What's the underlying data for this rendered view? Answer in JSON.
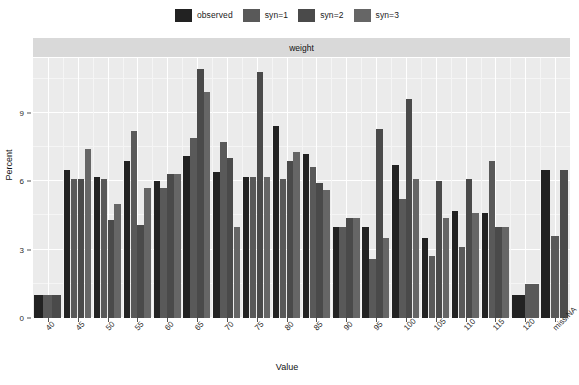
{
  "chart_data": {
    "type": "bar",
    "title": "weight",
    "xlabel": "Value",
    "ylabel": "Percent",
    "ylim": [
      0,
      11.4
    ],
    "yticks": [
      0,
      3,
      6,
      9
    ],
    "grid": true,
    "legend_position": "top",
    "categories": [
      "40",
      "45",
      "50",
      "55",
      "60",
      "65",
      "70",
      "75",
      "80",
      "85",
      "90",
      "95",
      "100",
      "105",
      "110",
      "115",
      "120",
      "miss.NA"
    ],
    "series": [
      {
        "name": "observed",
        "color": "#222222",
        "values": [
          1.0,
          6.5,
          6.2,
          6.9,
          6.0,
          7.1,
          6.4,
          6.2,
          8.4,
          7.2,
          4.0,
          4.0,
          6.7,
          3.5,
          4.7,
          4.6,
          1.0,
          6.5
        ]
      },
      {
        "name": "syn=1",
        "color": "#595959",
        "values": [
          1.0,
          6.1,
          6.1,
          8.2,
          5.7,
          7.9,
          7.7,
          6.2,
          6.1,
          6.6,
          4.0,
          2.6,
          5.2,
          2.7,
          3.1,
          6.9,
          1.5,
          3.6
        ]
      },
      {
        "name": "syn=2",
        "color": "#4a4a4a",
        "values": [
          1.0,
          6.1,
          4.3,
          4.1,
          6.3,
          10.9,
          7.0,
          10.8,
          6.9,
          5.9,
          4.4,
          8.3,
          9.6,
          6.0,
          6.1,
          4.0,
          0.0,
          6.5
        ]
      },
      {
        "name": "syn=3",
        "color": "#666666",
        "values": [
          0.0,
          7.4,
          4.0,
          6.0,
          6.3,
          9.9,
          4.0,
          6.2,
          7.3,
          5.6,
          4.4,
          3.5,
          0.0,
          0.0,
          0.0,
          0.0,
          0.0,
          0.0
        ]
      }
    ],
    "bar_groups": [
      {
        "category": "40",
        "bars": [
          1.0,
          1.0,
          1.0
        ]
      },
      {
        "category": "45",
        "bars": [
          6.5,
          6.1,
          6.1,
          7.4
        ]
      },
      {
        "category": "50",
        "bars": [
          6.2,
          6.1,
          4.3,
          5.0
        ]
      },
      {
        "category": "55",
        "bars": [
          6.9,
          8.2,
          4.1,
          5.7
        ]
      },
      {
        "category": "60",
        "bars": [
          6.0,
          5.7,
          6.3,
          6.3
        ]
      },
      {
        "category": "65",
        "bars": [
          7.1,
          7.9,
          10.9,
          9.9
        ]
      },
      {
        "category": "70",
        "bars": [
          6.4,
          7.7,
          7.0,
          4.0
        ]
      },
      {
        "category": "75",
        "bars": [
          6.2,
          6.2,
          10.8,
          6.2
        ]
      },
      {
        "category": "80",
        "bars": [
          8.4,
          6.1,
          6.9,
          7.3
        ]
      },
      {
        "category": "85",
        "bars": [
          7.2,
          6.6,
          5.9,
          5.6
        ]
      },
      {
        "category": "90",
        "bars": [
          4.0,
          4.0,
          4.4,
          4.4
        ]
      },
      {
        "category": "95",
        "bars": [
          4.0,
          2.6,
          8.3,
          3.5
        ]
      },
      {
        "category": "100",
        "bars": [
          6.7,
          5.2,
          9.6,
          6.1
        ]
      },
      {
        "category": "105",
        "bars": [
          3.5,
          2.7,
          6.0,
          4.4
        ]
      },
      {
        "category": "110",
        "bars": [
          4.7,
          3.1,
          6.1,
          4.6
        ]
      },
      {
        "category": "115",
        "bars": [
          4.6,
          6.9,
          4.0,
          4.0
        ]
      },
      {
        "category": "120",
        "bars": [
          1.0,
          1.5
        ]
      },
      {
        "category": "miss.NA",
        "bars": [
          6.5,
          3.6,
          6.5
        ]
      }
    ]
  },
  "legend": {
    "entries": [
      {
        "label": "observed",
        "color": "#222222"
      },
      {
        "label": "syn=1",
        "color": "#595959"
      },
      {
        "label": "syn=2",
        "color": "#4a4a4a"
      },
      {
        "label": "syn=3",
        "color": "#666666"
      }
    ]
  },
  "panel": {
    "strip_label": "weight"
  },
  "axes": {
    "y_label": "Percent",
    "x_label": "Value",
    "y_ticks": [
      "0",
      "3",
      "6",
      "9"
    ],
    "x_ticks": [
      "40",
      "45",
      "50",
      "55",
      "60",
      "65",
      "70",
      "75",
      "80",
      "85",
      "90",
      "95",
      "100",
      "105",
      "110",
      "115",
      "120",
      "miss.NA"
    ]
  },
  "colors": {
    "panel_background": "#ebebeb",
    "strip_background": "#d9d9d9",
    "gridline": "#ffffff",
    "page_background": "#ffffff"
  }
}
